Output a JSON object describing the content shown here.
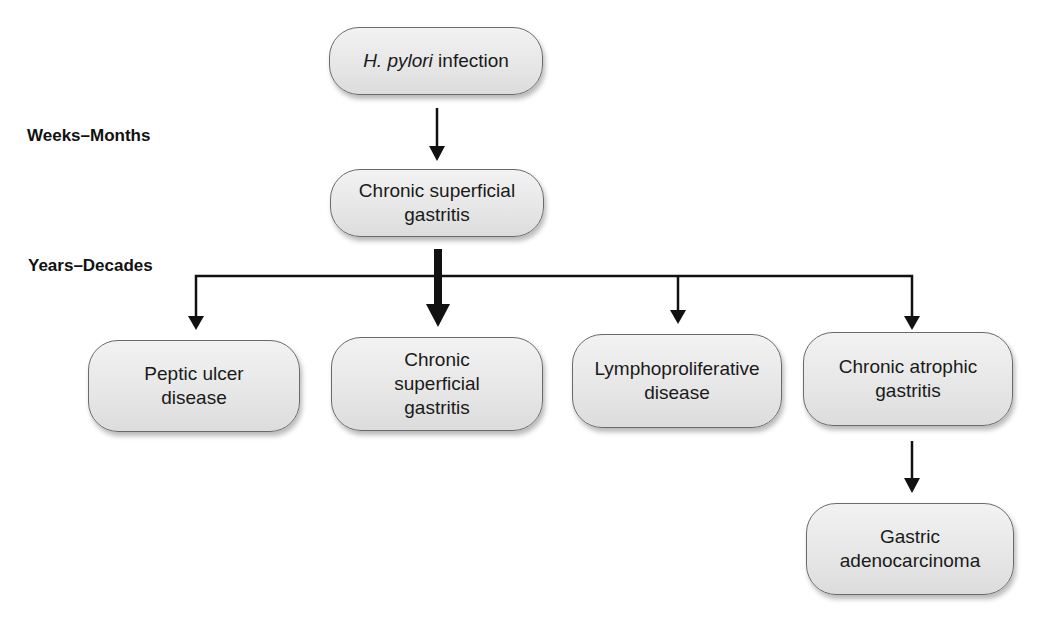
{
  "diagram": {
    "stages": {
      "early": "Weeks–Months",
      "late": "Years–Decades"
    },
    "nodes": {
      "infection": {
        "organism": "H. pylori",
        "suffix": " infection"
      },
      "superficial_gastritis": {
        "label": "Chronic superficial\ngastritis"
      },
      "outcomes": [
        {
          "id": "peptic-ulcer",
          "label": "Peptic ulcer\ndisease"
        },
        {
          "id": "chronic-superficial",
          "label": "Chronic\nsuperficial\ngastritis",
          "emphasized": true
        },
        {
          "id": "lymphoproliferative",
          "label": "Lymphoproliferative\ndisease"
        },
        {
          "id": "chronic-atrophic",
          "label": "Chronic atrophic\ngastritis"
        }
      ],
      "adenocarcinoma": {
        "label": "Gastric\nadenocarcinoma"
      }
    },
    "edges": [
      {
        "from": "infection",
        "to": "superficial_gastritis"
      },
      {
        "from": "superficial_gastritis",
        "to": "peptic-ulcer"
      },
      {
        "from": "superficial_gastritis",
        "to": "chronic-superficial",
        "emphasized": true
      },
      {
        "from": "superficial_gastritis",
        "to": "lymphoproliferative"
      },
      {
        "from": "superficial_gastritis",
        "to": "chronic-atrophic"
      },
      {
        "from": "chronic-atrophic",
        "to": "adenocarcinoma"
      }
    ]
  }
}
